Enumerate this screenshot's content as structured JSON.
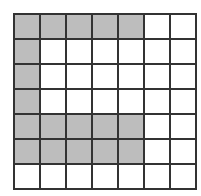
{
  "grid": {
    "rows": 7,
    "cols": 7,
    "shaded_color": "#bdbdbd",
    "empty_color": "#ffffff",
    "line_color": "#333333",
    "cells": [
      [
        1,
        1,
        1,
        1,
        1,
        0,
        0
      ],
      [
        1,
        0,
        0,
        0,
        0,
        0,
        0
      ],
      [
        1,
        0,
        0,
        0,
        0,
        0,
        0
      ],
      [
        1,
        0,
        0,
        0,
        0,
        0,
        0
      ],
      [
        1,
        1,
        1,
        1,
        1,
        0,
        0
      ],
      [
        1,
        1,
        1,
        1,
        1,
        0,
        0
      ],
      [
        0,
        0,
        0,
        0,
        0,
        0,
        0
      ]
    ]
  }
}
